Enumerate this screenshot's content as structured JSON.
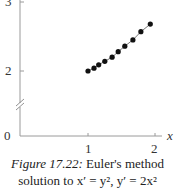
{
  "chart_data": {
    "type": "scatter",
    "title": "",
    "xlabel": "x",
    "ylabel": "",
    "x": [
      1.0,
      1.09,
      1.16,
      1.25,
      1.36,
      1.45,
      1.55,
      1.67,
      1.79,
      1.93
    ],
    "y": [
      2.0,
      2.04,
      2.09,
      2.14,
      2.2,
      2.28,
      2.36,
      2.45,
      2.57,
      2.68
    ],
    "connected": true,
    "xticks": [
      "1",
      "2"
    ],
    "yticks": [
      "0",
      "2",
      "3"
    ],
    "xlim": [
      0,
      2.2
    ],
    "ylim": [
      0,
      3
    ],
    "y_axis_break": true,
    "grid": false,
    "legend": null
  },
  "axes": {
    "x_label": "x",
    "x_tick_1": "1",
    "x_tick_2": "2",
    "y_tick_0": "0",
    "y_tick_2": "2",
    "y_tick_3": "3"
  },
  "caption": {
    "label": "Figure 17.22:",
    "line1_rest": " Euler's method",
    "line2": "solution to x′ = y², y′ = 2x²"
  }
}
